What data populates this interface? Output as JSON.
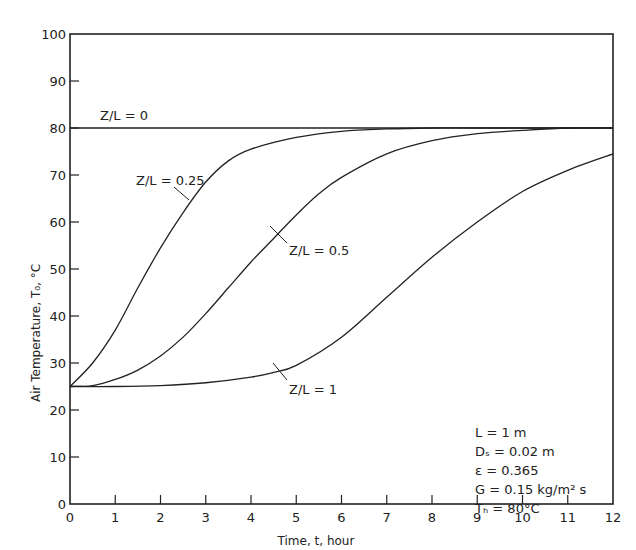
{
  "chart_data": {
    "type": "line",
    "title": "",
    "xlabel": "Time, t, hour",
    "ylabel": "Air Temperature, T₀, °C",
    "xlim": [
      0,
      12
    ],
    "ylim": [
      0,
      100
    ],
    "xticks": [
      0,
      1,
      2,
      3,
      4,
      5,
      6,
      7,
      8,
      9,
      10,
      11,
      12
    ],
    "yticks": [
      0,
      10,
      20,
      30,
      40,
      50,
      60,
      70,
      80,
      90,
      100
    ],
    "grid": false,
    "legend": "inline labels",
    "series": [
      {
        "name": "Z/L = 0",
        "x": [
          0,
          12
        ],
        "y": [
          80,
          80
        ]
      },
      {
        "name": "Z/L = 0.25",
        "x": [
          0,
          0.5,
          1,
          1.5,
          2,
          2.5,
          3,
          3.5,
          4,
          5,
          6,
          7,
          8,
          9,
          10,
          11,
          12
        ],
        "y": [
          25,
          30,
          37,
          46,
          54.5,
          62,
          68.5,
          73,
          75.5,
          78,
          79.3,
          79.8,
          80,
          80,
          80,
          80,
          80
        ]
      },
      {
        "name": "Z/L = 0.5",
        "x": [
          0,
          0.5,
          1,
          1.5,
          2,
          2.5,
          3,
          3.5,
          4,
          4.5,
          5,
          5.5,
          6,
          7,
          8,
          9,
          10,
          11,
          12
        ],
        "y": [
          25,
          25.2,
          26.5,
          28.5,
          31.5,
          35.5,
          40.5,
          46,
          51.5,
          56.5,
          61.5,
          66,
          69.5,
          74.5,
          77.3,
          78.8,
          79.5,
          80,
          80
        ]
      },
      {
        "name": "Z/L = 1",
        "x": [
          0,
          1,
          2,
          3,
          4,
          4.5,
          5,
          6,
          7,
          8,
          9,
          10,
          11,
          12
        ],
        "y": [
          25,
          25,
          25.2,
          25.8,
          27,
          28,
          29.5,
          35.5,
          44,
          52.5,
          60,
          66.5,
          71,
          74.5
        ]
      }
    ],
    "annotations": [
      {
        "text": "Z/L = 0",
        "x": 0.7,
        "y": 81.5
      },
      {
        "text": "Z/L = 0.25",
        "x": 1.5,
        "y": 70
      },
      {
        "text": "Z/L = 0.5",
        "x": 5.0,
        "y": 53
      },
      {
        "text": "Z/L = 1",
        "x": 4.8,
        "y": 23
      }
    ],
    "parameters": [
      "L = 1 m",
      "D_s = 0.02 m",
      "ε = 0.365",
      "G = 0.15 kg/m² s",
      "T_h = 80°C"
    ]
  },
  "labels": {
    "xlabel": "Time, t, hour",
    "ylabel": "Air Temperature, T₀, °C",
    "curve_0": "Z/L = 0",
    "curve_025": "Z/L = 0.25",
    "curve_05": "Z/L = 0.5",
    "curve_1": "Z/L = 1",
    "param_L": "L  = 1 m",
    "param_Ds": "Dₛ = 0.02 m",
    "param_eps": "ε  = 0.365",
    "param_G": "G = 0.15  kg/m² s",
    "param_Th": "Tₕ = 80°C"
  }
}
